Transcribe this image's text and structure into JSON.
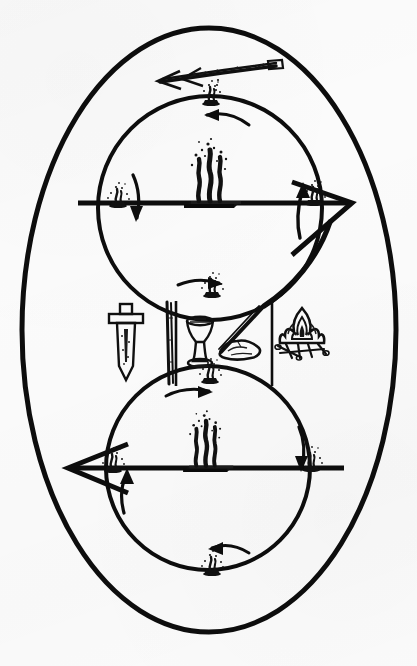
{
  "figure": {
    "background_color": "#fbfbfb",
    "ink_color": "#0d0d0d",
    "width": 417,
    "height": 666
  },
  "outer_boundary": {
    "shape": "ellipse",
    "name": "outer-oval",
    "cx": 209,
    "cy": 330,
    "rx": 188,
    "ry": 303,
    "stroke_width": 5
  },
  "circles": [
    {
      "id": "upper-circle",
      "label": "Upper circle",
      "cx": 210,
      "cy": 208,
      "r": 113,
      "stroke_width": 4
    },
    {
      "id": "lower-circle",
      "label": "Lower circle",
      "cx": 208,
      "cy": 468,
      "r": 103,
      "stroke_width": 4
    }
  ],
  "axes": [
    {
      "id": "upper-axis",
      "label": "Upper horizontal axis",
      "x1": 78,
      "x2": 345,
      "y": 203,
      "stroke_width": 5
    },
    {
      "id": "lower-axis",
      "label": "Lower horizontal axis",
      "x1": 73,
      "x2": 344,
      "y": 468,
      "stroke_width": 5
    }
  ],
  "braziers": [
    {
      "id": "upper-center-brazier",
      "label": "Large smoking brazier on plinth (upper center)",
      "x": 210,
      "y": 199,
      "size": "large"
    },
    {
      "id": "lower-center-brazier",
      "label": "Large smoking brazier on plinth (lower center)",
      "x": 208,
      "y": 464,
      "size": "large"
    },
    {
      "id": "upper-left-censer",
      "label": "Small censer at upper-left intersection",
      "x": 118,
      "y": 203,
      "size": "small"
    },
    {
      "id": "upper-right-censer",
      "label": "Small censer at upper-right intersection",
      "x": 314,
      "y": 200,
      "size": "small"
    },
    {
      "id": "upper-top-censer",
      "label": "Small censer at top of upper circle",
      "x": 210,
      "y": 100,
      "size": "small"
    },
    {
      "id": "upper-bottom-censer",
      "label": "Small censer at bottom of upper circle",
      "x": 212,
      "y": 292,
      "size": "small"
    },
    {
      "id": "lower-left-censer",
      "label": "Small censer at lower-left intersection",
      "x": 113,
      "y": 468,
      "size": "small"
    },
    {
      "id": "lower-right-censer",
      "label": "Small censer at lower-right intersection",
      "x": 311,
      "y": 466,
      "size": "small"
    },
    {
      "id": "lower-top-censer",
      "label": "Small censer at top of lower circle",
      "x": 210,
      "y": 378,
      "size": "small"
    },
    {
      "id": "lower-bottom-censer",
      "label": "Small censer at bottom of lower circle",
      "x": 212,
      "y": 570,
      "size": "small"
    }
  ],
  "flow_arrows": [
    {
      "id": "upper-top-arrow",
      "label": "Leftward arrow below top censer (upper circle)",
      "direction": "left"
    },
    {
      "id": "upper-left-arrow",
      "label": "Downward arrow at upper-left intersection",
      "direction": "down"
    },
    {
      "id": "upper-right-arrow",
      "label": "Upward arrow at upper-right intersection",
      "direction": "up"
    },
    {
      "id": "upper-bottom-arrow",
      "label": "Rightward arrow at bottom of upper circle",
      "direction": "right"
    },
    {
      "id": "lower-top-arrow",
      "label": "Rightward arrow at top of lower circle",
      "direction": "right"
    },
    {
      "id": "lower-left-arrow",
      "label": "Upward arrow at lower-left intersection",
      "direction": "up"
    },
    {
      "id": "lower-right-arrow",
      "label": "Downward arrow at lower-right intersection",
      "direction": "down"
    },
    {
      "id": "lower-bottom-arrow",
      "label": "Leftward arrow at bottom of lower circle",
      "direction": "left"
    }
  ],
  "axis_arrowheads": [
    {
      "id": "upper-right-arrowhead",
      "label": "Large open arrowhead pointing right on upper axis",
      "direction": "right"
    },
    {
      "id": "lower-left-arrowhead",
      "label": "Large open arrowhead pointing left on lower axis",
      "direction": "left"
    }
  ],
  "diagonal_link": {
    "id": "descending-diagonal",
    "label": "Long descending diagonal stroke joining upper circle to middle band"
  },
  "wand": {
    "id": "double-headed-wand",
    "label": "Double-headed arrow wand above the upper circle",
    "x": 215,
    "y": 72
  },
  "middle_band": {
    "id": "middle-band",
    "label": "Central band of ritual implements",
    "frame": {
      "x": 174,
      "y": 300,
      "width": 100,
      "height": 86
    },
    "implements": [
      {
        "id": "sword",
        "label": "Sword / dagger pointing downward",
        "x": 126,
        "y": 345
      },
      {
        "id": "staff",
        "label": "Vertical staff or wand",
        "x": 168,
        "y": 345
      },
      {
        "id": "chalice",
        "label": "Chalice / goblet",
        "x": 200,
        "y": 342
      },
      {
        "id": "diagonal-rod",
        "label": "Diagonal rod or sword blade",
        "x": 240,
        "y": 330
      },
      {
        "id": "stone",
        "label": "Stone / pentacle disc",
        "x": 240,
        "y": 350
      },
      {
        "id": "bonfire",
        "label": "Bonfire with logs",
        "x": 302,
        "y": 340
      }
    ]
  }
}
